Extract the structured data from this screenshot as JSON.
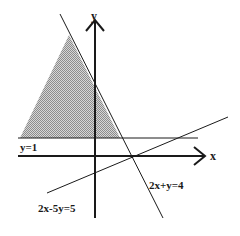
{
  "diagram": {
    "type": "linear-inequality-region",
    "axes": {
      "x_label": "x",
      "y_label": "y"
    },
    "lines": [
      {
        "id": "line-y1",
        "label": "y=1"
      },
      {
        "id": "line-2x-plus-y",
        "label": "2x+y=4"
      },
      {
        "id": "line-2x-minus-5y",
        "label": "2x-5y=5"
      }
    ],
    "shaded_region": {
      "description": "Region bounded above y=1 and left of 2x+y=4",
      "fill_color": "#b8b8b8"
    },
    "colors": {
      "line": "#1a1a1a",
      "shade": "#b8b8b8",
      "background": "#ffffff"
    }
  }
}
